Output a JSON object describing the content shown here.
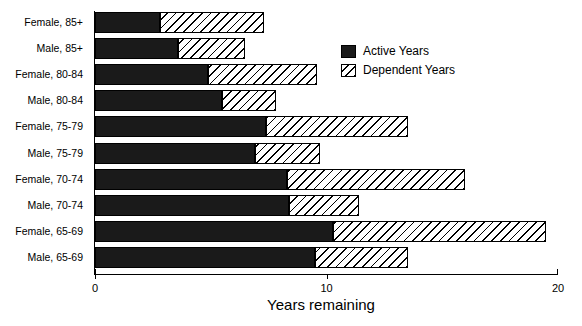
{
  "chart_data": {
    "type": "bar",
    "orientation": "horizontal",
    "stacked": true,
    "title": "",
    "xlabel": "Years remaining",
    "ylabel": "",
    "xlim": [
      0,
      20
    ],
    "xticks": [
      0,
      10,
      20
    ],
    "xtick_labels": [
      "0",
      "10",
      "20"
    ],
    "grid": false,
    "legend_position": "upper-center",
    "categories": [
      "Female, 85+",
      "Male, 85+",
      "Female, 80-84",
      "Male, 80-84",
      "Female, 75-79",
      "Male, 75-79",
      "Female, 70-74",
      "Male, 70-74",
      "Female, 65-69",
      "Male, 65-69"
    ],
    "series": [
      {
        "name": "Active Years",
        "color": "#1a1a1a",
        "pattern": "solid",
        "values": [
          2.8,
          3.6,
          4.9,
          5.5,
          7.4,
          6.9,
          8.3,
          8.4,
          10.3,
          9.5
        ]
      },
      {
        "name": "Dependent Years",
        "color": "#ffffff",
        "pattern": "diagonal-hatch",
        "values": [
          4.5,
          2.9,
          4.7,
          2.3,
          6.1,
          2.8,
          7.7,
          3.0,
          9.2,
          4.0
        ]
      }
    ],
    "totals": [
      7.3,
      6.5,
      9.6,
      7.8,
      13.5,
      9.7,
      16.0,
      11.4,
      19.5,
      13.5
    ]
  },
  "legend": {
    "items": [
      {
        "label": "Active Years",
        "swatch": "solid-black-swatch"
      },
      {
        "label": "Dependent Years",
        "swatch": "hatched-swatch"
      }
    ]
  },
  "axis": {
    "x_title": "Years remaining"
  }
}
